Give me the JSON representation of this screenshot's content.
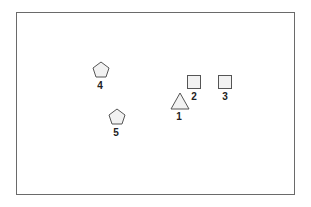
{
  "diagram": {
    "frame": {
      "stroke": "#6a6a6a"
    },
    "shape_fill": "#f2f2f2",
    "shape_stroke": "#555555",
    "items": [
      {
        "id": "1",
        "shape": "triangle",
        "label": "1"
      },
      {
        "id": "2",
        "shape": "square",
        "label": "2"
      },
      {
        "id": "3",
        "shape": "square",
        "label": "3"
      },
      {
        "id": "4",
        "shape": "pentagon",
        "label": "4"
      },
      {
        "id": "5",
        "shape": "pentagon",
        "label": "5"
      }
    ]
  }
}
